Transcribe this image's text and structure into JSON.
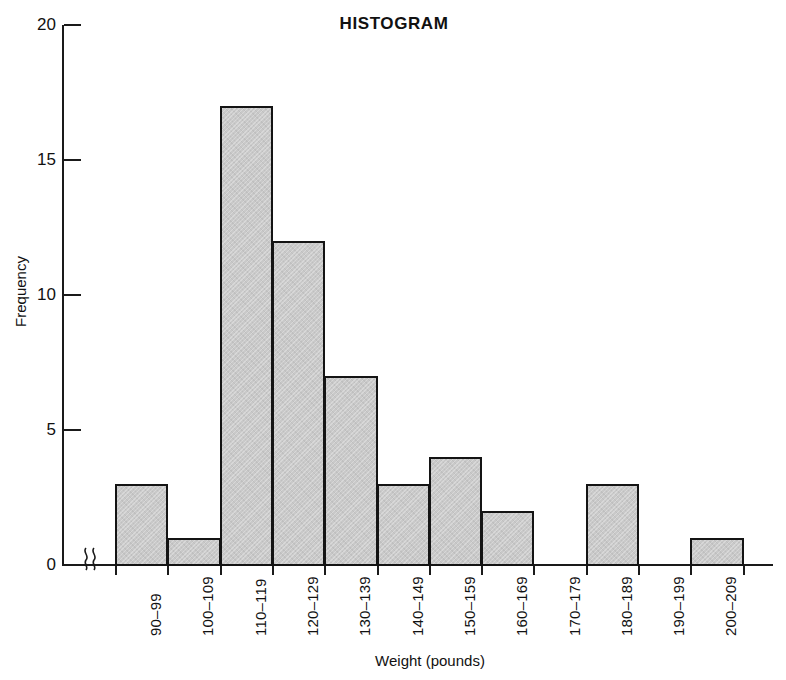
{
  "chart_data": {
    "type": "bar",
    "title": "HISTOGRAM",
    "xlabel": "Weight (pounds)",
    "ylabel": "Frequency",
    "categories": [
      "90–99",
      "100–109",
      "110–119",
      "120–129",
      "130–139",
      "140–149",
      "150–159",
      "160–169",
      "170–179",
      "180–189",
      "190–199",
      "200–209"
    ],
    "values": [
      3,
      1,
      17,
      12,
      7,
      3,
      4,
      2,
      0,
      3,
      0,
      1
    ],
    "ylim": [
      0,
      20
    ],
    "ytick_labels": [
      "20",
      "15",
      "10",
      "5",
      "0"
    ],
    "ytick_values": [
      20,
      15,
      10,
      5,
      0
    ],
    "grid": false,
    "legend": "none",
    "bar_fill_color": "#c9c9c9",
    "bar_edge_color": "#141414",
    "axis_color": "#1a1a1a",
    "axis_break": "squiggle-break-symbol"
  }
}
